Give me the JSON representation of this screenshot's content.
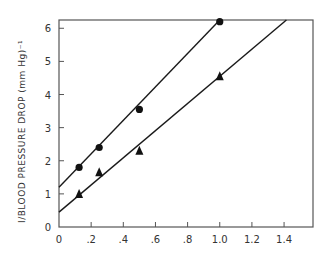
{
  "chart_data": {
    "type": "scatter",
    "title": "",
    "xlabel": "",
    "ylabel": "I/BLOOD PRESSURE DROP (mm Hg)⁻¹",
    "xlim": [
      0,
      1.58
    ],
    "ylim": [
      0,
      6.25
    ],
    "grid": false,
    "legend": "none",
    "x_ticks": [
      {
        "value": 0,
        "label": "0"
      },
      {
        "value": 0.2,
        "label": ".2"
      },
      {
        "value": 0.4,
        "label": ".4"
      },
      {
        "value": 0.6,
        "label": ".6"
      },
      {
        "value": 0.8,
        "label": ".8"
      },
      {
        "value": 1.0,
        "label": "1.0"
      },
      {
        "value": 1.2,
        "label": "1.2"
      },
      {
        "value": 1.4,
        "label": "1.4"
      }
    ],
    "y_ticks": [
      {
        "value": 0,
        "label": "0"
      },
      {
        "value": 1,
        "label": "1"
      },
      {
        "value": 2,
        "label": "2"
      },
      {
        "value": 3,
        "label": "3"
      },
      {
        "value": 4,
        "label": "4"
      },
      {
        "value": 5,
        "label": "5"
      },
      {
        "value": 6,
        "label": "6"
      }
    ],
    "series": [
      {
        "name": "circles",
        "marker": "circle",
        "x": [
          0.125,
          0.25,
          0.5,
          1.0
        ],
        "y": [
          1.8,
          2.4,
          3.55,
          6.2
        ],
        "fit_line": {
          "intercept": 1.2,
          "slope": 5.05,
          "x_range": [
            0,
            1.0
          ]
        }
      },
      {
        "name": "triangles",
        "marker": "triangle",
        "x": [
          0.125,
          0.25,
          0.5,
          1.0
        ],
        "y": [
          1.0,
          1.65,
          2.3,
          4.55
        ],
        "fit_line": {
          "intercept": 0.45,
          "slope": 4.1,
          "x_range": [
            0,
            1.42
          ]
        }
      }
    ]
  }
}
